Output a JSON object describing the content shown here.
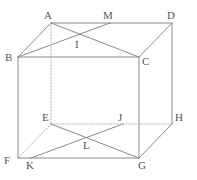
{
  "figure": {
    "width": 197,
    "height": 180,
    "background_color": "#ffffff",
    "line_color": "#8a8a8a",
    "hidden_line_color": "#a8a8a8",
    "label_color": "#555555",
    "line_width": 1,
    "label_font_size": 11
  },
  "labels": {
    "A": "A",
    "M": "M",
    "D": "D",
    "I": "I",
    "B": "B",
    "C": "C",
    "E": "E",
    "J": "J",
    "H": "H",
    "L": "L",
    "F": "F",
    "K": "K",
    "G": "G"
  },
  "points": {
    "A": {
      "x": 51,
      "y": 23
    },
    "M": {
      "x": 110,
      "y": 23
    },
    "D": {
      "x": 172,
      "y": 23
    },
    "I": {
      "x": 79,
      "y": 37
    },
    "B": {
      "x": 18,
      "y": 57
    },
    "C": {
      "x": 139,
      "y": 57
    },
    "E": {
      "x": 51,
      "y": 124
    },
    "J": {
      "x": 123,
      "y": 124
    },
    "H": {
      "x": 172,
      "y": 124
    },
    "L": {
      "x": 87,
      "y": 138
    },
    "F": {
      "x": 18,
      "y": 158
    },
    "K": {
      "x": 31,
      "y": 158
    },
    "G": {
      "x": 139,
      "y": 158
    }
  },
  "label_positions": {
    "A": {
      "x": 44,
      "y": 10
    },
    "M": {
      "x": 103,
      "y": 10
    },
    "D": {
      "x": 167,
      "y": 10
    },
    "I": {
      "x": 75,
      "y": 39
    },
    "B": {
      "x": 5,
      "y": 52
    },
    "C": {
      "x": 142,
      "y": 56
    },
    "E": {
      "x": 42,
      "y": 112
    },
    "J": {
      "x": 118,
      "y": 112
    },
    "H": {
      "x": 175,
      "y": 112
    },
    "L": {
      "x": 83,
      "y": 140
    },
    "F": {
      "x": 4,
      "y": 155
    },
    "K": {
      "x": 26,
      "y": 160
    },
    "G": {
      "x": 138,
      "y": 160
    }
  },
  "edges": [
    {
      "name": "edge-A-M",
      "from": "A",
      "to": "M",
      "style": "solid"
    },
    {
      "name": "edge-M-D",
      "from": "M",
      "to": "D",
      "style": "solid"
    },
    {
      "name": "edge-A-B",
      "from": "A",
      "to": "B",
      "style": "solid"
    },
    {
      "name": "edge-D-C",
      "from": "D",
      "to": "C",
      "style": "solid"
    },
    {
      "name": "edge-B-C",
      "from": "B",
      "to": "C",
      "style": "solid"
    },
    {
      "name": "edge-D-H",
      "from": "D",
      "to": "H",
      "style": "solid"
    },
    {
      "name": "edge-B-F",
      "from": "B",
      "to": "F",
      "style": "solid"
    },
    {
      "name": "edge-C-G",
      "from": "C",
      "to": "G",
      "style": "solid"
    },
    {
      "name": "edge-F-K",
      "from": "F",
      "to": "K",
      "style": "solid"
    },
    {
      "name": "edge-K-G",
      "from": "K",
      "to": "G",
      "style": "solid"
    },
    {
      "name": "edge-G-H",
      "from": "G",
      "to": "H",
      "style": "solid"
    },
    {
      "name": "diagonal-A-C",
      "from": "A",
      "to": "C",
      "style": "solid"
    },
    {
      "name": "diagonal-M-B",
      "from": "M",
      "to": "B",
      "style": "solid"
    },
    {
      "name": "diagonal-E-G",
      "from": "E",
      "to": "G",
      "style": "solid"
    },
    {
      "name": "diagonal-J-K",
      "from": "J",
      "to": "K",
      "style": "solid"
    },
    {
      "name": "edge-A-E-hidden",
      "from": "A",
      "to": "E",
      "style": "dotted"
    },
    {
      "name": "edge-E-J-hidden",
      "from": "E",
      "to": "J",
      "style": "dotted"
    },
    {
      "name": "edge-J-H-hidden",
      "from": "J",
      "to": "H",
      "style": "dotted"
    },
    {
      "name": "edge-E-F-hidden",
      "from": "E",
      "to": "F",
      "style": "dotted"
    }
  ]
}
